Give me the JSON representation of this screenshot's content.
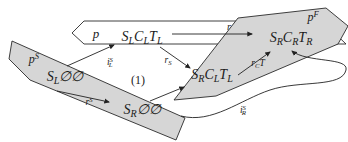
{
  "figure": {
    "equation_number": "(1)",
    "planes": {
      "top": {
        "label": "p"
      },
      "start": {
        "label": "p^S"
      },
      "front": {
        "label": "p^F"
      }
    },
    "nodes": {
      "top_left": "S_LC_LT_L",
      "top_right": "S_RC_RT_R",
      "mid": "S_RC_LT_L",
      "bottom_left": "S_L∅∅",
      "bottom_mid": "S_R∅∅"
    },
    "arrows": {
      "r": "r",
      "i_left": "i^S_L",
      "r_s": "r_S",
      "r_ct": "r_CT",
      "r_s_lower": "r^S",
      "i_right": "i^S_R"
    }
  },
  "colors": {
    "background": "#ffffff",
    "plane_fill": "#d6d6d6",
    "plane_top_fill": "#ffffff",
    "ink": "#1b1b1b"
  }
}
